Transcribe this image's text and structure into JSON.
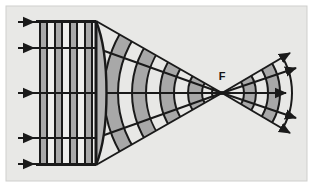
{
  "figure": {
    "caption": "",
    "canvas": {
      "width": 313,
      "height": 187
    },
    "frame": {
      "x": 6,
      "y": 6,
      "width": 301,
      "height": 175,
      "background_color": "#e8e8e6",
      "border_color": "#cfcfcd",
      "border_width": 1
    },
    "colors": {
      "page_background": "#ffffff",
      "panel_background": "#e8e8e6",
      "ink": "#1a1a1a",
      "band_shaded": "#a8a8a8",
      "band_light": "#eeeeec",
      "lens_fill": "#b5b5b5",
      "label_color": "#141414"
    },
    "optical_axis": {
      "y": 93,
      "x_start": 18,
      "x_end": 299,
      "arrow_at_end": true
    },
    "lens": {
      "name": "converging-lens",
      "vertex_x": 96,
      "top_y": 21,
      "bottom_y": 165,
      "curve_bulge_x": 108,
      "stroke_width": 2.2
    },
    "focal_point": {
      "label": "F",
      "x": 222,
      "y": 93,
      "label_x": 222,
      "label_y": 80
    },
    "incoming_rays": {
      "count": 5,
      "x_start": 18,
      "x_end": 96,
      "arrow_x": 30,
      "y_values": [
        22,
        48,
        93,
        138,
        164
      ]
    },
    "incoming_wavefronts": {
      "description": "Vertical plane wavefronts before the lens",
      "top_y": 21,
      "bottom_y": 165,
      "x_positions": [
        40,
        47,
        55,
        62,
        70,
        77,
        85,
        92
      ],
      "shaded_pairs": [
        [
          40,
          47
        ],
        [
          55,
          62
        ],
        [
          70,
          77
        ],
        [
          85,
          92
        ]
      ]
    },
    "converging_wavefronts": {
      "description": "Curved wavefronts between lens and focus, centered on F",
      "radii": [
        118,
        104,
        90,
        76,
        62,
        48,
        34,
        20,
        10
      ],
      "shaded_radius_pairs": [
        [
          118,
          104
        ],
        [
          90,
          76
        ],
        [
          62,
          48
        ],
        [
          34,
          20
        ]
      ],
      "half_angle_deg": 33
    },
    "diverging_wavefronts": {
      "description": "Curved wavefronts after the focus, centered on F",
      "radii": [
        22,
        34,
        46,
        58,
        70
      ],
      "shaded_radius_pairs": [
        [
          22,
          34
        ],
        [
          46,
          58
        ]
      ],
      "half_angle_deg": 31
    },
    "converging_rays": {
      "count": 5,
      "from_lens_edge": true,
      "y_at_lens": [
        21,
        48,
        93,
        138,
        165
      ]
    },
    "diverging_rays": {
      "count": 5,
      "x_end": 299,
      "y_end": [
        48,
        62,
        93,
        124,
        138
      ]
    }
  }
}
